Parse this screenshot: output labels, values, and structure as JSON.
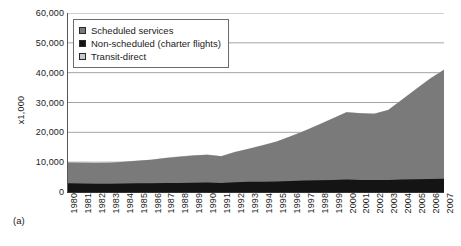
{
  "panel_label": "(a)",
  "legend": {
    "position": "top-left-inside",
    "items": [
      {
        "label": "Scheduled services",
        "color": "#7a7a7a"
      },
      {
        "label": "Non-scheduled (charter flights)",
        "color": "#141414"
      },
      {
        "label": "Transit-direct",
        "color": "#c9c9c9"
      }
    ]
  },
  "chart_data": {
    "type": "area",
    "stacked": true,
    "title": "",
    "subtitle": "",
    "xlabel": "",
    "ylabel": "x1,000",
    "xlim": [
      1980,
      2007
    ],
    "ylim": [
      0,
      60000
    ],
    "grid": true,
    "grid_axis": "y",
    "ytick_labels": [
      "60,000",
      "50,000",
      "40,000",
      "30,000",
      "20,000",
      "10,000",
      "0"
    ],
    "yticks": [
      60000,
      50000,
      40000,
      30000,
      20000,
      10000,
      0
    ],
    "categories": [
      "1980",
      "1981",
      "1982",
      "1983",
      "1984",
      "1985",
      "1986",
      "1987",
      "1988",
      "1989",
      "1990",
      "1991",
      "1992",
      "1993",
      "1994",
      "1995",
      "1996",
      "1997",
      "1998",
      "1999",
      "2000",
      "2001",
      "2002",
      "2003",
      "2004",
      "2005",
      "2006",
      "2007"
    ],
    "series": [
      {
        "name": "Non-scheduled (charter flights)",
        "color": "#141414",
        "values": [
          2900,
          2850,
          2800,
          2800,
          2850,
          2900,
          2900,
          3000,
          3050,
          3100,
          3150,
          3050,
          3300,
          3400,
          3450,
          3550,
          3700,
          3850,
          3950,
          4050,
          4150,
          4050,
          4000,
          4050,
          4200,
          4300,
          4350,
          4400
        ]
      },
      {
        "name": "Scheduled services",
        "color": "#7a7a7a",
        "values": [
          7000,
          6950,
          6900,
          7000,
          7300,
          7600,
          7900,
          8400,
          8800,
          9100,
          9300,
          8950,
          10100,
          11100,
          12200,
          13400,
          15000,
          16700,
          18600,
          20600,
          22600,
          22350,
          22200,
          23450,
          26800,
          30200,
          33650,
          36600
        ]
      },
      {
        "name": "Transit-direct",
        "color": "#c9c9c9",
        "values": [
          100,
          100,
          100,
          100,
          100,
          100,
          100,
          100,
          100,
          100,
          100,
          100,
          100,
          100,
          100,
          100,
          100,
          100,
          100,
          100,
          100,
          100,
          100,
          100,
          100,
          100,
          100,
          100
        ]
      }
    ],
    "totals": [
      10000,
      9900,
      9800,
      9900,
      10250,
      10600,
      10900,
      11500,
      11950,
      12300,
      12550,
      12100,
      13500,
      14600,
      15750,
      17050,
      18800,
      20650,
      22650,
      24750,
      26850,
      26500,
      26300,
      27600,
      31100,
      34600,
      38100,
      41100
    ]
  }
}
